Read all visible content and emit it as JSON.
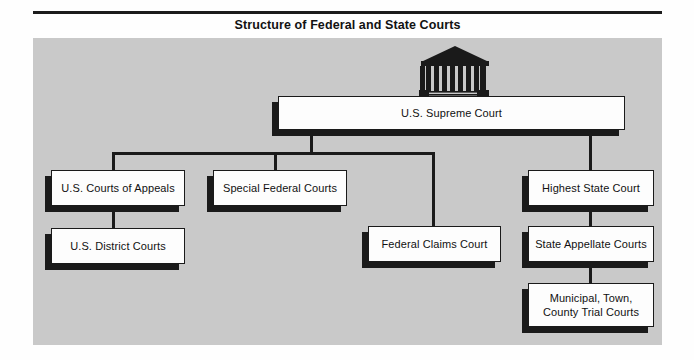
{
  "title": "Structure of Federal and State Courts",
  "icon": {
    "name": "supreme-court-building-icon",
    "columns": 8
  },
  "colors": {
    "panel_background": "#c9c9c9",
    "page_background": "#fefefe",
    "line": "#1a1a1a",
    "box_fill": "#fdfdfd",
    "box_border": "#1a1a1a",
    "box_shadow": "#1a1a1a",
    "title_text": "#121212",
    "label_text": "#111111"
  },
  "nodes": {
    "supreme_court": "U.S. Supreme Court",
    "courts_of_appeals": "U.S. Courts of Appeals",
    "district_courts": "U.S. District Courts",
    "special_federal_courts": "Special Federal Courts",
    "federal_claims_court": "Federal Claims Court",
    "highest_state_court": "Highest State Court",
    "state_appellate_courts": "State Appellate Courts",
    "trial_courts": "Municipal, Town,\nCounty Trial Courts"
  },
  "hierarchy": {
    "root": "U.S. Supreme Court",
    "federal_branch": [
      "U.S. Courts of Appeals",
      "Special Federal Courts",
      "Federal Claims Court",
      "U.S. District Courts"
    ],
    "state_branch": [
      "Highest State Court",
      "State Appellate Courts",
      "Municipal, Town, County Trial Courts"
    ]
  }
}
